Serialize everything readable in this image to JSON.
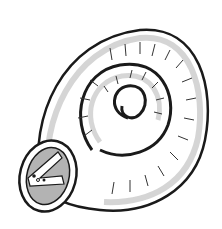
{
  "image": {
    "subject": "coiled shell illustration",
    "description": "Black-and-white line drawing of a spiraling tube forming a snail-like shell, with an open end at lower left showing a grey interior",
    "colors": {
      "background": "#ffffff",
      "outline": "#1a1a1a",
      "shading": "#555555",
      "interior": "#b3b3b3"
    }
  }
}
